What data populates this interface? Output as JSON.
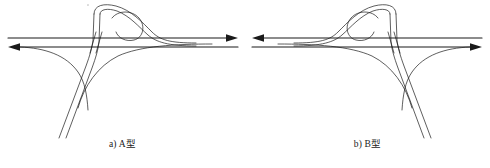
{
  "figure": {
    "title": "",
    "background_color": "#ffffff",
    "line_color": "#1a1a1a",
    "panels": [
      {
        "id": "panel-a",
        "caption": "a) A型",
        "label_prefix": "a)",
        "type_label": "A型",
        "mirrored": false,
        "description": "T形互通立交 A型 匝道布置图",
        "elements": {
          "mainline_upper_direction": "right",
          "mainline_lower_direction": "left",
          "loop_side": "right",
          "minor_road_direction": "down-left"
        }
      },
      {
        "id": "panel-b",
        "caption": "b) B型",
        "label_prefix": "b)",
        "type_label": "B型",
        "mirrored": true,
        "description": "T形互通立交 B型 匝道布置图",
        "elements": {
          "mainline_upper_direction": "right",
          "mainline_lower_direction": "left",
          "loop_side": "left",
          "minor_road_direction": "down-right"
        }
      }
    ]
  },
  "geometry": {
    "mainline_upper_y": 38,
    "mainline_lower_y": 47,
    "mainline_x_start": 8,
    "mainline_x_end": 238,
    "junction_x": 97,
    "loop_center_x": 148,
    "loop_center_y": 20,
    "stroke_width_main": 1.1,
    "stroke_width_ramp": 0.7
  }
}
